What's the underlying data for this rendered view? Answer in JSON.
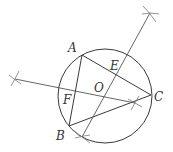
{
  "diagram": {
    "title": "",
    "colors": {
      "stroke": "#3a3a3a",
      "construction": "#777777",
      "background": "#ffffff"
    },
    "points": {
      "A": {
        "label": "A",
        "x": 82,
        "y": 55
      },
      "B": {
        "label": "B",
        "x": 69,
        "y": 126
      },
      "C": {
        "label": "C",
        "x": 151,
        "y": 95
      },
      "O": {
        "label": "O",
        "x": 104,
        "y": 93
      },
      "E": {
        "label": "E",
        "x": 117,
        "y": 75
      },
      "F": {
        "label": "F",
        "x": 76,
        "y": 90
      }
    },
    "labels": {
      "A": "A",
      "B": "B",
      "C": "C",
      "O": "O",
      "E": "E",
      "F": "F"
    },
    "circle": {
      "cx": 105,
      "cy": 96,
      "r": 47
    },
    "segments": [
      {
        "from": "A",
        "to": "B"
      },
      {
        "from": "A",
        "to": "C"
      },
      {
        "from": "B",
        "to": "C"
      }
    ],
    "construction_lines": [
      {
        "name": "bisector-AC",
        "x1": 150,
        "y1": 13,
        "x2": 82,
        "y2": 137
      },
      {
        "name": "bisector-AB",
        "x1": 15,
        "y1": 79,
        "x2": 135,
        "y2": 103
      }
    ],
    "arc_marks": [
      {
        "x": 150,
        "y": 13
      },
      {
        "x": 82,
        "y": 137
      },
      {
        "x": 15,
        "y": 79
      },
      {
        "x": 135,
        "y": 103
      }
    ]
  }
}
